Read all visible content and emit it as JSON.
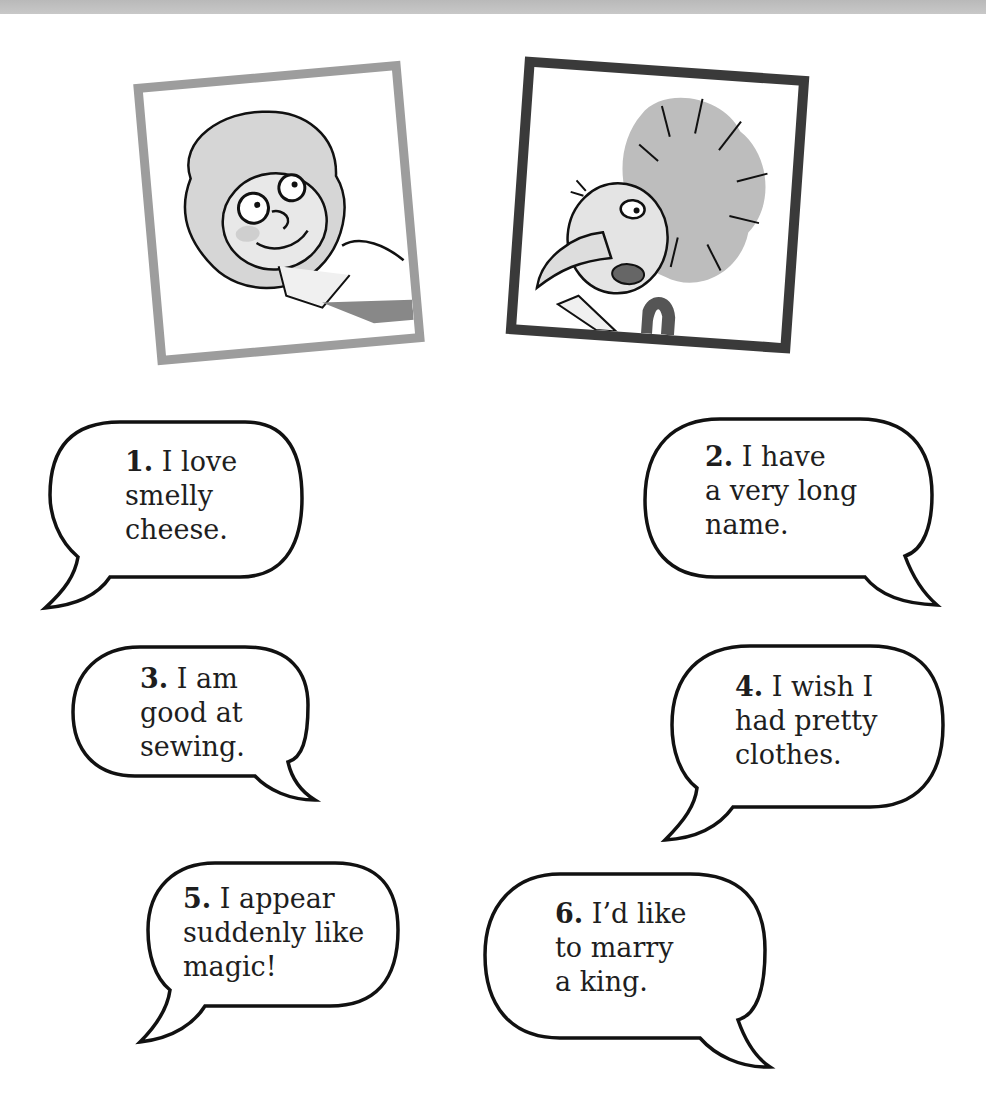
{
  "page": {
    "portraits": [
      {
        "id": "girl",
        "description": "smiling girl with curly hair",
        "frame_color": "#9d9d9d"
      },
      {
        "id": "imp",
        "description": "long-nosed imp with wild hair",
        "frame_color": "#3a3a3a"
      }
    ],
    "bubbles": [
      {
        "number": "1.",
        "lines": [
          "I love",
          "smelly",
          "cheese."
        ]
      },
      {
        "number": "2.",
        "lines": [
          "I have",
          "a very long",
          "name."
        ]
      },
      {
        "number": "3.",
        "lines": [
          "I am",
          "good at",
          "sewing."
        ]
      },
      {
        "number": "4.",
        "lines": [
          "I wish I",
          "had pretty",
          "clothes."
        ]
      },
      {
        "number": "5.",
        "lines": [
          "I appear",
          "suddenly like",
          "magic!"
        ]
      },
      {
        "number": "6.",
        "lines": [
          "I’d like",
          "to marry",
          "a king."
        ]
      }
    ]
  }
}
